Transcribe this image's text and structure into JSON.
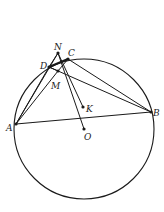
{
  "diagram": {
    "type": "geometry",
    "circle": {
      "center": "O",
      "cx": 84,
      "cy": 129,
      "r": 70
    },
    "points": [
      {
        "id": "N",
        "label": "N",
        "x": 58,
        "y": 53,
        "lx": 54,
        "ly": 50
      },
      {
        "id": "C",
        "label": "C",
        "x": 68,
        "y": 59,
        "lx": 68,
        "ly": 56
      },
      {
        "id": "D",
        "label": "D",
        "x": 49,
        "y": 67,
        "lx": 40,
        "ly": 69
      },
      {
        "id": "M",
        "label": "M",
        "x": 58,
        "y": 71,
        "lx": 51,
        "ly": 89
      },
      {
        "id": "K",
        "label": "K",
        "x": 83,
        "y": 107,
        "lx": 86,
        "ly": 112
      },
      {
        "id": "A",
        "label": "A",
        "x": 16,
        "y": 124,
        "lx": 6,
        "ly": 131
      },
      {
        "id": "B",
        "label": "B",
        "x": 151,
        "y": 112,
        "lx": 153,
        "ly": 116
      },
      {
        "id": "O",
        "label": "O",
        "x": 84,
        "y": 129,
        "lx": 84,
        "ly": 140
      }
    ],
    "segments": [
      {
        "from": "A",
        "to": "B",
        "width": 1.1
      },
      {
        "from": "A",
        "to": "N",
        "width": 1.0
      },
      {
        "from": "A",
        "to": "M",
        "width": 1.0
      },
      {
        "from": "A",
        "to": "D",
        "width": 1.0
      },
      {
        "from": "D",
        "to": "C",
        "width": 2.0
      },
      {
        "from": "D",
        "to": "B",
        "width": 1.0
      },
      {
        "from": "C",
        "to": "B",
        "width": 1.0
      },
      {
        "from": "N",
        "to": "O",
        "width": 1.0
      },
      {
        "from": "N",
        "to": "K",
        "width": 1.0
      },
      {
        "from": "D",
        "to": "M",
        "width": 1.0
      },
      {
        "from": "M",
        "to": "C",
        "width": 1.0
      },
      {
        "from": "N",
        "to": "D",
        "width": 1.0
      }
    ],
    "dots": [
      "N",
      "C",
      "D",
      "M",
      "K",
      "O",
      "A",
      "B"
    ],
    "colors": {
      "stroke": "#1a1a1a",
      "label": "#222222",
      "background": "#ffffff"
    }
  }
}
